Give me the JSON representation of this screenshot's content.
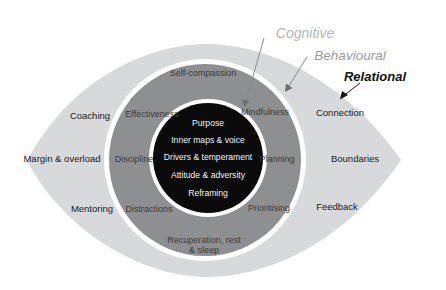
{
  "diagram": {
    "colors": {
      "outer_ring": "#d8d9da",
      "middle_ring": "#8e8f91",
      "core": "#0a0a0a",
      "ring_divider": "#ffffff",
      "background": "#ffffff",
      "cognitive_label": "#b4b4b4",
      "behavioural_label": "#9a9a9a",
      "relational_label": "#111111"
    },
    "callouts": [
      {
        "label": "Cognitive",
        "x": 305,
        "y": 33,
        "target_x": 243,
        "target_y": 107
      },
      {
        "label": "Behavioural",
        "x": 350,
        "y": 55,
        "target_x": 284,
        "target_y": 92
      },
      {
        "label": "Relational",
        "x": 375,
        "y": 76,
        "target_x": 340,
        "target_y": 99
      }
    ],
    "core_ring": {
      "name": "Cognitive",
      "items": [
        {
          "label": "Purpose",
          "x": 208,
          "y": 124
        },
        {
          "label": "Inner maps & voice",
          "x": 208,
          "y": 141
        },
        {
          "label": "Drivers & temperament",
          "x": 208,
          "y": 158
        },
        {
          "label": "Attitude & adversity",
          "x": 208,
          "y": 176
        },
        {
          "label": "Reframing",
          "x": 208,
          "y": 194
        }
      ]
    },
    "middle_ring": {
      "name": "Behavioural",
      "items": [
        {
          "label": "Self-compassion",
          "x": 203,
          "y": 73,
          "lines": [
            "Self-compassion"
          ]
        },
        {
          "label": "Effectiveness",
          "x": 152,
          "y": 114,
          "lines": [
            "Effectiveness"
          ]
        },
        {
          "label": "Mindfulness",
          "x": 265,
          "y": 112,
          "lines": [
            "Mindfulness"
          ]
        },
        {
          "label": "Discipline",
          "x": 134,
          "y": 159,
          "lines": [
            "Discipline"
          ]
        },
        {
          "label": "Planning",
          "x": 277,
          "y": 159,
          "lines": [
            "Planning"
          ]
        },
        {
          "label": "Distractions",
          "x": 149,
          "y": 209,
          "lines": [
            "Distractions"
          ]
        },
        {
          "label": "Prioritising",
          "x": 269,
          "y": 208,
          "lines": [
            "Prioritising"
          ]
        },
        {
          "label": "Recuperation, rest & sleep",
          "x": 204,
          "y": 245,
          "lines": [
            "Recuperation, rest",
            "& sleep"
          ]
        }
      ]
    },
    "outer_ring": {
      "name": "Relational",
      "items": [
        {
          "label": "Coaching",
          "x": 90,
          "y": 116
        },
        {
          "label": "Margin & overload",
          "x": 62,
          "y": 159
        },
        {
          "label": "Mentoring",
          "x": 92,
          "y": 209
        },
        {
          "label": "Connection",
          "x": 340,
          "y": 113
        },
        {
          "label": "Boundaries",
          "x": 355,
          "y": 159
        },
        {
          "label": "Feedback",
          "x": 337,
          "y": 207
        }
      ]
    }
  }
}
